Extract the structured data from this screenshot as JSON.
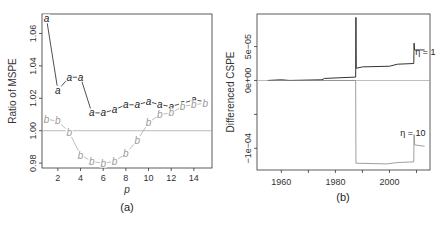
{
  "chart_data": [
    {
      "type": "line",
      "panel_label": "(a)",
      "title": "",
      "xlabel": "p",
      "ylabel": "Ratio of MSPE",
      "xlim": [
        0.6,
        15.6
      ],
      "ylim": [
        0.977,
        1.072
      ],
      "xticks": [
        2,
        4,
        6,
        8,
        10,
        12,
        14
      ],
      "yticks": [
        0.98,
        1.0,
        1.02,
        1.04,
        1.06
      ],
      "ytick_labels": [
        "0.98",
        "1.00",
        "1.02",
        "1.04",
        "1.06"
      ],
      "reference_line": 1.0,
      "x": [
        1,
        2,
        3,
        4,
        5,
        6,
        7,
        8,
        9,
        10,
        11,
        12,
        13,
        14,
        15
      ],
      "series": [
        {
          "name": "a",
          "marker": "a",
          "color": "#222222",
          "values": [
            1.069,
            1.025,
            1.033,
            1.033,
            1.011,
            1.011,
            1.013,
            1.016,
            1.016,
            1.018,
            1.016,
            1.015,
            1.017,
            1.019,
            1.018
          ]
        },
        {
          "name": "b",
          "marker": "b",
          "color": "#999999",
          "values": [
            1.007,
            1.006,
            0.999,
            0.985,
            0.981,
            0.98,
            0.981,
            0.986,
            0.994,
            1.005,
            1.01,
            1.011,
            1.015,
            1.016,
            1.017
          ]
        }
      ]
    },
    {
      "type": "line",
      "panel_label": "(b)",
      "title": "",
      "xlabel": "",
      "ylabel": "Differenced CSPE",
      "xlim": [
        1951,
        2015
      ],
      "ylim": [
        -0.000132,
        9.8e-05
      ],
      "xticks": [
        1960,
        1970,
        1980,
        1990,
        2000,
        2010
      ],
      "xtick_labels": [
        "1960",
        "",
        "1980",
        "",
        "2000",
        ""
      ],
      "yticks": [
        5e-05,
        0,
        -5e-05,
        -0.0001
      ],
      "ytick_labels": [
        "5e−05",
        "0e+00",
        "",
        "−1e−04"
      ],
      "reference_line": 0,
      "series": [
        {
          "name": "η = 1",
          "color": "#333333",
          "points": [
            [
              1955,
              0
            ],
            [
              1960,
              1e-06
            ],
            [
              1963,
              0
            ],
            [
              1975,
              1e-06
            ],
            [
              1976,
              3e-06
            ],
            [
              1987.5,
              5e-06
            ],
            [
              1987.6,
              9.3e-05
            ],
            [
              1987.7,
              1.8e-05
            ],
            [
              1990,
              2e-05
            ],
            [
              2000,
              2.1e-05
            ],
            [
              2003,
              2.4e-05
            ],
            [
              2009,
              2.5e-05
            ],
            [
              2009.1,
              5.5e-05
            ],
            [
              2009.3,
              4.5e-05
            ],
            [
              2013,
              4.5e-05
            ]
          ]
        },
        {
          "name": "η = 10",
          "color": "#888888",
          "points": [
            [
              1955,
              0
            ],
            [
              1987.5,
              0
            ],
            [
              1987.6,
              -0.000122
            ],
            [
              1999,
              -0.000123
            ],
            [
              2003,
              -0.000121
            ],
            [
              2009,
              -0.00012
            ],
            [
              2009.1,
              -8e-05
            ],
            [
              2009.3,
              -9.5e-05
            ],
            [
              2013,
              -9.7e-05
            ]
          ]
        }
      ],
      "annotations": [
        {
          "text": "η = 1",
          "near_series": "η = 1"
        },
        {
          "text": "η = 10",
          "near_series": "η = 10"
        }
      ]
    }
  ]
}
